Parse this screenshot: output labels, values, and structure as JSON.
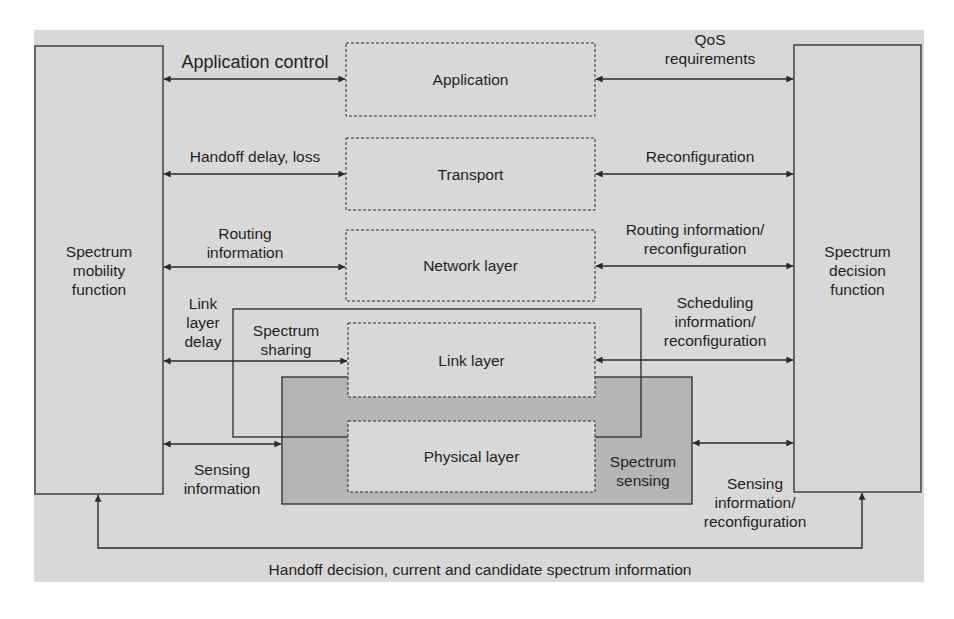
{
  "diagram": {
    "type": "cognitive radio cross-layer spectrum management",
    "colors": {
      "background_panel": "#d8d8d8",
      "sensing_box_fill": "#b5b5b5",
      "line": "#2a2a2a",
      "text": "#1f1f1f"
    },
    "left_block": {
      "label": "Spectrum\nmobility\nfunction"
    },
    "right_block": {
      "label": "Spectrum\ndecision\nfunction"
    },
    "layers": [
      {
        "id": "application",
        "label": "Application"
      },
      {
        "id": "transport",
        "label": "Transport"
      },
      {
        "id": "network",
        "label": "Network layer"
      },
      {
        "id": "link",
        "label": "Link layer"
      },
      {
        "id": "physical",
        "label": "Physical layer"
      }
    ],
    "grouping_boxes": {
      "spectrum_sharing": {
        "label": "Spectrum\nsharing"
      },
      "spectrum_sensing": {
        "label": "Spectrum\nsensing"
      }
    },
    "left_edges": [
      {
        "to": "application",
        "label": "Application control"
      },
      {
        "to": "transport",
        "label": "Handoff delay, loss"
      },
      {
        "to": "network",
        "label": "Routing\ninformation"
      },
      {
        "to": "link",
        "label": "Link\nlayer\ndelay"
      },
      {
        "to": "spectrum_sensing",
        "label": "Sensing\ninformation"
      }
    ],
    "right_edges": [
      {
        "from": "application",
        "label": "QoS\nrequirements"
      },
      {
        "from": "transport",
        "label": "Reconfiguration"
      },
      {
        "from": "network",
        "label": "Routing information/\nreconfiguration"
      },
      {
        "from": "link",
        "label": "Scheduling\ninformation/\nreconfiguration"
      },
      {
        "from": "spectrum_sensing",
        "label": "Sensing\ninformation/\nreconfiguration"
      }
    ],
    "feedback_edge": {
      "from": "right_block",
      "to": "left_block",
      "label": "Handoff decision, current and candidate spectrum information"
    }
  }
}
